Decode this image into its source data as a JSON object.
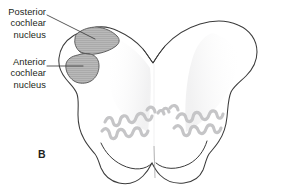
{
  "figure": {
    "panel_letter": "B",
    "labels": [
      {
        "id": "posterior-cochlear-nucleus",
        "line1": "Posterior",
        "line2": "cochlear",
        "line3": "nucleus"
      },
      {
        "id": "anterior-cochlear-nucleus",
        "line1": "Anterior",
        "line2": "cochlear",
        "line3": "nucleus"
      }
    ],
    "structures": {
      "brainstem_section": "medulla-oblongata-cross-section",
      "shaded_nuclei": [
        "posterior-cochlear-nucleus",
        "anterior-cochlear-nucleus"
      ],
      "stippled_nuclei": [
        "left-inferior-olivary-nucleus",
        "right-inferior-olivary-nucleus"
      ]
    },
    "colors": {
      "background": "#ffffff",
      "outline": "#3b3b3b",
      "text": "#231f20",
      "nucleus_fill": "#b5b5b5",
      "nucleus_stroke": "#5a5a5a",
      "olive_gray": "#c9c9c9",
      "leader_line": "#3b3b3b",
      "midline_shade": "#ececed"
    }
  }
}
